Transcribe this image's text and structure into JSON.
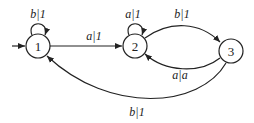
{
  "diagram": {
    "type": "finite-state-transducer",
    "states": [
      {
        "id": "1",
        "label": "1",
        "initial": true
      },
      {
        "id": "2",
        "label": "2"
      },
      {
        "id": "3",
        "label": "3"
      }
    ],
    "transitions": [
      {
        "from": "1",
        "to": "1",
        "label": "b|1"
      },
      {
        "from": "1",
        "to": "2",
        "label": "a|1"
      },
      {
        "from": "2",
        "to": "2",
        "label": "a|1"
      },
      {
        "from": "2",
        "to": "3",
        "label": "b|1"
      },
      {
        "from": "3",
        "to": "2",
        "label": "a|a"
      },
      {
        "from": "3",
        "to": "1",
        "label": "b|1"
      }
    ]
  }
}
